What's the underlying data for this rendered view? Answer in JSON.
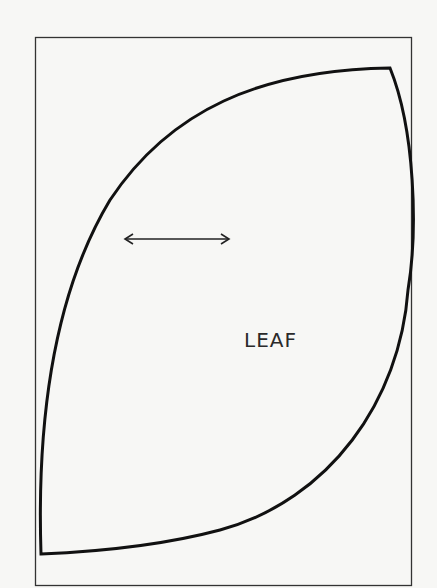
{
  "diagram": {
    "type": "sewing-pattern-piece",
    "piece_label": "LEAF",
    "grainline": "horizontal-double-arrow",
    "colors": {
      "background": "#f7f7f5",
      "outline": "#111111",
      "border": "#333333",
      "text": "#2a2a2a"
    }
  }
}
